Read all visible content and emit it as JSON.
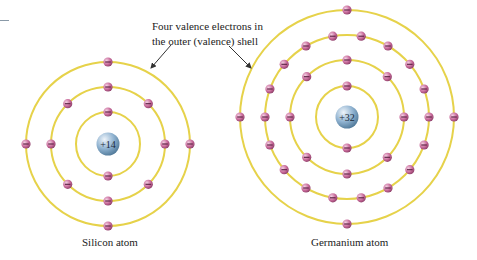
{
  "annotation": {
    "line1": "Four valence electrons in",
    "line2": "the outer (valence) shell"
  },
  "colors": {
    "shell": "#e6d24a",
    "electron": "#c86a9a",
    "electron_highlight": "#f0c4dc",
    "electron_minus": "#5a2040",
    "nucleus": "#7fa6c8",
    "nucleus_highlight": "#e4eef7",
    "arrow": "#333333"
  },
  "atoms": [
    {
      "name": "silicon",
      "caption": "Silicon atom",
      "nucleus_label": "+14",
      "cx": 108,
      "cy": 144,
      "shells": [
        {
          "r": 32,
          "electrons": 2,
          "offset_deg": 0
        },
        {
          "r": 57,
          "electrons": 8,
          "offset_deg": 0
        },
        {
          "r": 82,
          "electrons": 4,
          "offset_deg": 0
        }
      ]
    },
    {
      "name": "germanium",
      "caption": "Germanium atom",
      "nucleus_label": "+32",
      "cx": 347,
      "cy": 117,
      "shells": [
        {
          "r": 31,
          "electrons": 2,
          "offset_deg": 0
        },
        {
          "r": 57,
          "electrons": 8,
          "offset_deg": 0
        },
        {
          "r": 82,
          "electrons": 18,
          "offset_deg": 10
        },
        {
          "r": 107,
          "electrons": 4,
          "offset_deg": 0
        }
      ]
    }
  ]
}
